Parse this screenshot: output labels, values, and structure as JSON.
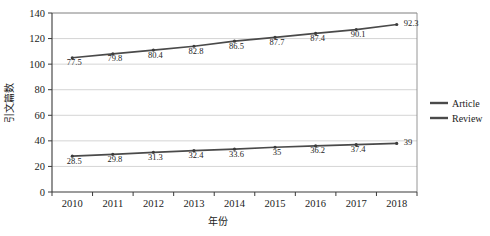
{
  "chart_data": {
    "type": "line",
    "title": "",
    "xlabel": "年份",
    "ylabel": "引文篇数",
    "x": [
      2010,
      2011,
      2012,
      2013,
      2014,
      2015,
      2016,
      2017,
      2018
    ],
    "categories": [
      "2010",
      "2011",
      "2012",
      "2013",
      "2014",
      "2015",
      "2016",
      "2017",
      "2018"
    ],
    "ylim": [
      0,
      140
    ],
    "yticks": [
      0,
      20,
      40,
      60,
      80,
      100,
      120,
      140
    ],
    "ytick_labels": [
      "0",
      "20",
      "40",
      "60",
      "80",
      "100",
      "120",
      "140"
    ],
    "grid": true,
    "legend_position": "right",
    "series": [
      {
        "name": "Article",
        "values": [
          105,
          108,
          111,
          114,
          118,
          121,
          124,
          127,
          131
        ],
        "point_labels": [
          "77.5",
          "79.8",
          "80.4",
          "82.8",
          "86.5",
          "87.7",
          "87.4",
          "90.1",
          "92.3"
        ],
        "color": "#4a4a4a"
      },
      {
        "name": "Review",
        "values": [
          28,
          29.5,
          31,
          32.3,
          33.5,
          35,
          36,
          37,
          38
        ],
        "point_labels": [
          "28.5",
          "29.8",
          "31.3",
          "32.4",
          "33.6",
          "35",
          "36.2",
          "37.4",
          "39"
        ],
        "color": "#4a4a4a"
      }
    ]
  },
  "legend": {
    "items": [
      {
        "label": "Article"
      },
      {
        "label": "Review"
      }
    ]
  }
}
